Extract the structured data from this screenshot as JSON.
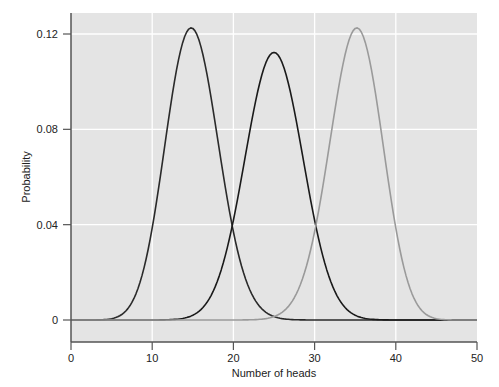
{
  "chart_data": {
    "type": "line",
    "title": "",
    "xlabel": "Number of heads",
    "ylabel": "Probability",
    "xlim": [
      0,
      50
    ],
    "ylim": [
      -0.0075,
      0.1325
    ],
    "xticks": [
      0,
      10,
      20,
      30,
      40,
      50
    ],
    "xtick_labels": [
      "0",
      "10",
      "20",
      "30",
      "40",
      "50"
    ],
    "yticks": [
      0,
      0.04,
      0.08,
      0.12
    ],
    "ytick_labels": [
      "0",
      "0.04",
      "0.08",
      "0.12"
    ],
    "grid": true,
    "legend": null,
    "series": [
      {
        "name": "Binomial n=50, p=0.3",
        "color": "#2a2a2a",
        "n": 50,
        "p": 0.3,
        "peak_x": 15,
        "peak_y": 0.122
      },
      {
        "name": "Binomial n=50, p=0.5",
        "color": "#1a1a1a",
        "n": 50,
        "p": 0.5,
        "peak_x": 25,
        "peak_y": 0.112
      },
      {
        "name": "Binomial n=50, p=0.7",
        "color": "#9a9a9a",
        "n": 50,
        "p": 0.7,
        "peak_x": 35,
        "peak_y": 0.122
      }
    ]
  },
  "colors": {
    "plot_background": "#e4e4e4",
    "gridline": "#ffffff",
    "axis": "#555555"
  }
}
